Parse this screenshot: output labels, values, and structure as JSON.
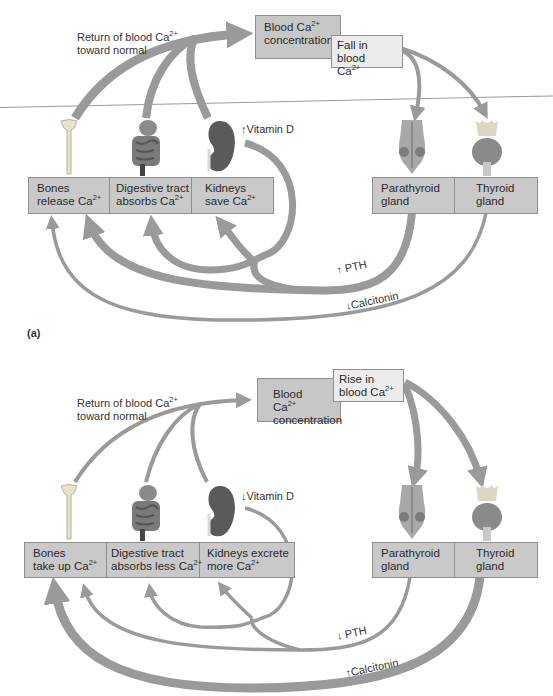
{
  "panel_a": {
    "label": "(a)",
    "return_label_line1": "Return of blood Ca",
    "return_label_line2": "toward normal",
    "blood_box": {
      "line1": "Blood Ca",
      "line2": "concentration"
    },
    "change_box": {
      "line1": "Fall in blood",
      "line2": "Ca"
    },
    "vitamin_d": {
      "arrow": "↑",
      "text": "Vitamin D"
    },
    "effectors": [
      {
        "line1": "Bones",
        "line2": "release Ca"
      },
      {
        "line1": "Digestive tract",
        "line2": "absorbs Ca"
      },
      {
        "line1": "Kidneys",
        "line2": "save Ca"
      }
    ],
    "glands": [
      {
        "line1": "Parathyroid",
        "line2": "gland"
      },
      {
        "line1": "Thyroid",
        "line2": "gland"
      }
    ],
    "pth": {
      "arrow": "↑",
      "text": "PTH"
    },
    "calcitonin": {
      "arrow": "↓",
      "text": "Calcitonin"
    }
  },
  "panel_b": {
    "return_label_line1": "Return of blood Ca",
    "return_label_line2": "toward normal",
    "blood_box": {
      "line1": "Blood Ca",
      "line2": "concentration"
    },
    "change_box": {
      "line1": "Rise in",
      "line2": "blood Ca"
    },
    "vitamin_d": {
      "arrow": "↓",
      "text": "Vitamin D"
    },
    "effectors": [
      {
        "line1": "Bones",
        "line2": "take up Ca"
      },
      {
        "line1": "Digestive tract",
        "line2": "absorbs less Ca"
      },
      {
        "line1": "Kidneys excrete",
        "line2": "more Ca"
      }
    ],
    "glands": [
      {
        "line1": "Parathyroid",
        "line2": "gland"
      },
      {
        "line1": "Thyroid",
        "line2": "gland"
      }
    ],
    "pth": {
      "arrow": "↓",
      "text": "PTH"
    },
    "calcitonin": {
      "arrow": "↑",
      "text": "Calcitonin"
    }
  },
  "ion_charge": "2+",
  "colors": {
    "arrow": "#9a9a9a",
    "box_dark": "#c7c7c7",
    "box_light": "#ececec",
    "border": "#8f8f8f"
  }
}
